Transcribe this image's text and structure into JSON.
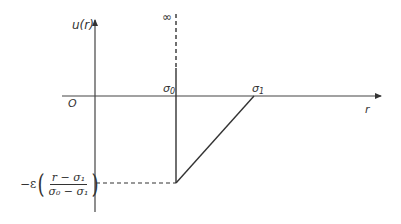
{
  "diagram": {
    "type": "potential-energy-plot",
    "axes": {
      "y_label": "u(r)",
      "x_label": "r",
      "origin_label": "O"
    },
    "markers": {
      "sigma0": "σ",
      "sigma0_sub": "0",
      "sigma1": "σ",
      "sigma1_sub": "1",
      "infinity": "∞"
    },
    "formula": {
      "prefix": "−ε",
      "open_paren": "(",
      "close_paren": ")",
      "numerator": "r − σ₁",
      "denominator": "σ₀ − σ₁"
    },
    "colors": {
      "line": "#333333",
      "axis": "#444444"
    }
  }
}
